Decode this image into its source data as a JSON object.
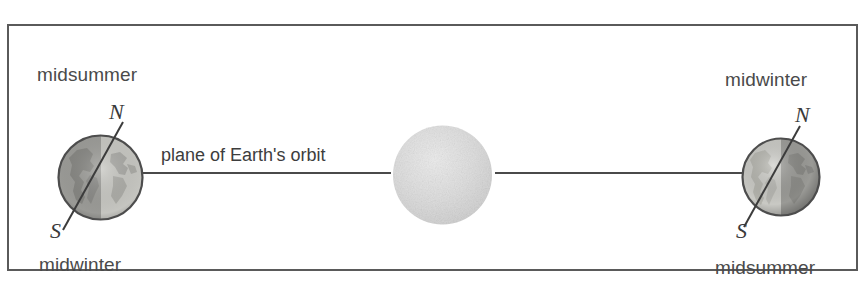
{
  "diagram": {
    "title": "plane of Earth's orbit",
    "type": "astronomy-seasons-diagram",
    "frame": {
      "border_color": "#5a5a5a",
      "background": "#ffffff"
    },
    "labels": {
      "orbit_plane": "plane of Earth's orbit",
      "left_top": "midsummer",
      "left_bottom": "midwinter",
      "right_top": "midwinter",
      "right_bottom": "midsummer"
    },
    "earth_left": {
      "name": "Earth at midsummer (northern hemisphere)",
      "axis_north_label": "N",
      "axis_south_label": "S",
      "lit_side": "right",
      "axis_tilt_degrees": 23.5
    },
    "earth_right": {
      "name": "Earth at midwinter (northern hemisphere)",
      "axis_north_label": "N",
      "axis_south_label": "S",
      "lit_side": "left",
      "axis_tilt_degrees": 23.5
    },
    "sun": {
      "name": "Sun",
      "color": "#d8d8d8"
    },
    "colors": {
      "line": "#4a4a4a",
      "text": "#4a4a4a",
      "earth_light": "#c8c8c4",
      "earth_dark": "#9a9a96",
      "earth_outline": "#4d4d4d",
      "sun_fill": "#dadada"
    }
  }
}
